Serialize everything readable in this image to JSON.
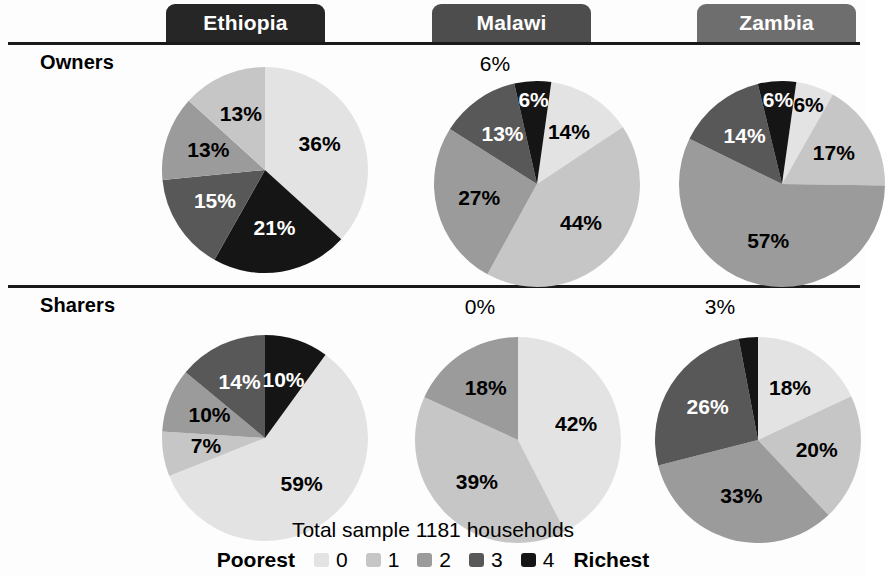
{
  "figure": {
    "row_labels": {
      "owners": "Owners",
      "sharers": "Sharers"
    },
    "columns": [
      {
        "name": "Ethiopia",
        "tab_color": "#262626"
      },
      {
        "name": "Malawi",
        "tab_color": "#4d4d4d"
      },
      {
        "name": "Zambia",
        "tab_color": "#6e6e6e"
      }
    ],
    "total_sample": "Total sample 1181 households",
    "legend": {
      "low_label": "Poorest",
      "high_label": "Richest",
      "keys": [
        "0",
        "1",
        "2",
        "3",
        "4"
      ],
      "colors": [
        "#e3e3e3",
        "#c6c6c6",
        "#9b9b9b",
        "#585858",
        "#151515"
      ]
    }
  },
  "chart_data": {
    "type": "pie",
    "subtitle": "Total sample 1181 households",
    "categories": [
      "0",
      "1",
      "2",
      "3",
      "4"
    ],
    "category_labels": [
      "Poorest",
      "1",
      "2",
      "3",
      "Richest"
    ],
    "colors": [
      "#e3e3e3",
      "#c6c6c6",
      "#9b9b9b",
      "#585858",
      "#151515"
    ],
    "units": "percent",
    "legend_position": "bottom",
    "panels": [
      {
        "row": "Owners",
        "country": "Ethiopia",
        "values": [
          36,
          13,
          13,
          15,
          21
        ],
        "labels": [
          "36%",
          "13%",
          "13%",
          "15%",
          "21%"
        ],
        "draw_order": [
          0,
          4,
          3,
          2,
          1
        ],
        "start_angle_deg": 0
      },
      {
        "row": "Owners",
        "country": "Malawi",
        "values": [
          14,
          44,
          27,
          13,
          6
        ],
        "labels": [
          "14%",
          "44%",
          "27%",
          "13%",
          "6%"
        ],
        "draw_order": [
          0,
          1,
          2,
          3,
          4
        ],
        "start_angle_deg": 8
      },
      {
        "row": "Owners",
        "country": "Zambia",
        "values": [
          6,
          17,
          57,
          14,
          6
        ],
        "labels": [
          "6%",
          "17%",
          "57%",
          "14%",
          "6%"
        ],
        "draw_order": [
          0,
          1,
          2,
          3,
          4
        ],
        "start_angle_deg": 8
      },
      {
        "row": "Sharers",
        "country": "Ethiopia",
        "values": [
          59,
          7,
          10,
          14,
          10
        ],
        "labels": [
          "59%",
          "7%",
          "10%",
          "14%",
          "10%"
        ],
        "draw_order": [
          0,
          1,
          2,
          3,
          4
        ],
        "start_angle_deg": 36
      },
      {
        "row": "Sharers",
        "country": "Malawi",
        "values": [
          42,
          39,
          18,
          0,
          0
        ],
        "labels": [
          "42%",
          "39%",
          "18%",
          "0%",
          "0%"
        ],
        "draw_order": [
          0,
          1,
          2,
          3,
          4
        ],
        "start_angle_deg": 0
      },
      {
        "row": "Sharers",
        "country": "Zambia",
        "values": [
          18,
          20,
          33,
          26,
          3
        ],
        "labels": [
          "18%",
          "20%",
          "33%",
          "26%",
          "3%"
        ],
        "draw_order": [
          0,
          1,
          2,
          3,
          4
        ],
        "start_angle_deg": 0
      }
    ],
    "external_labels": [
      {
        "row": "Owners",
        "country": "Malawi",
        "text": "6%"
      },
      {
        "row": "Sharers",
        "country": "Malawi",
        "text": "0%"
      },
      {
        "row": "Sharers",
        "country": "Zambia",
        "text": "3%"
      }
    ]
  }
}
